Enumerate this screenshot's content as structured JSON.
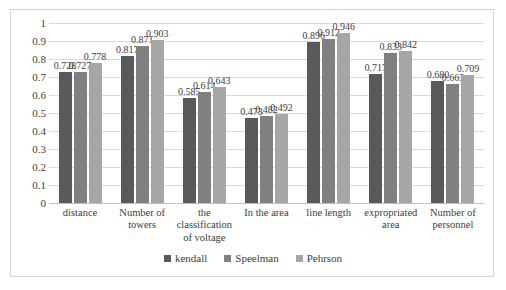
{
  "chart_data": {
    "type": "bar",
    "title": "",
    "xlabel": "",
    "ylabel": "",
    "ylim": [
      0,
      1
    ],
    "ytick_step": 0.1,
    "yticks": [
      "1",
      "0.9",
      "0.8",
      "0.7",
      "0.6",
      "0.5",
      "0.4",
      "0.3",
      "0.2",
      "0.1",
      "0"
    ],
    "grid": true,
    "legend_position": "bottom",
    "categories": [
      "distance",
      "Number of towers",
      "the classification of voltage",
      "In the area",
      "line length",
      "expropriated area",
      "Number of personnel"
    ],
    "series": [
      {
        "name": "kendall",
        "color": "#595959",
        "values": [
          0.728,
          0.817,
          0.585,
          0.473,
          0.896,
          0.717,
          0.68
        ],
        "labels": [
          "0.728",
          "0.817",
          "0.585",
          "0.473",
          "0.896",
          "0.717",
          "0.680"
        ]
      },
      {
        "name": "Speelman",
        "color": "#808080",
        "values": [
          0.727,
          0.871,
          0.614,
          0.482,
          0.912,
          0.833,
          0.663
        ],
        "labels": [
          "0.727",
          "0.871",
          "0.614",
          "0.482",
          "0.912",
          "0.833",
          "0.663"
        ]
      },
      {
        "name": "Pehrson",
        "color": "#a6a6a6",
        "values": [
          0.778,
          0.903,
          0.643,
          0.492,
          0.946,
          0.842,
          0.709
        ],
        "labels": [
          "0.778",
          "0.903",
          "0.643",
          "0.492",
          "0.946",
          "0.842",
          "0.709"
        ]
      }
    ]
  },
  "legend": {
    "items": [
      {
        "label": "kendall"
      },
      {
        "label": "Speelman"
      },
      {
        "label": "Pehrson"
      }
    ]
  }
}
